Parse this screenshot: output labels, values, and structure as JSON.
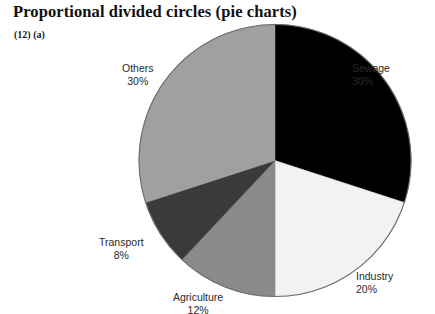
{
  "title": "Proportional divided circles (pie charts)",
  "caption": "(12) (a)",
  "chart_data": {
    "type": "pie",
    "title": "Proportional divided circles (pie charts)",
    "subtitle": "(12) (a)",
    "xlabel": "",
    "ylabel": "",
    "unit": "%",
    "start_angle_deg": 0,
    "direction": "clockwise",
    "legend": "none",
    "grid": false,
    "categories": [
      "Sewage",
      "Industry",
      "Agriculture",
      "Transport",
      "Others"
    ],
    "values": [
      30,
      20,
      12,
      8,
      30
    ],
    "labels": [
      "Sewage\n30%",
      "Industry\n20%",
      "Agriculture\n12%",
      "Transport\n8%",
      "Others\n30%"
    ],
    "colors": [
      "#000000",
      "#f2f2f2",
      "#8a8a8a",
      "#3a3a3a",
      "#a0a0a0"
    ],
    "slices": [
      {
        "name": "Sewage",
        "value": 30,
        "value_label": "30%",
        "color": "#000000",
        "start_deg": 0,
        "end_deg": 108
      },
      {
        "name": "Industry",
        "value": 20,
        "value_label": "20%",
        "color": "#f2f2f2",
        "start_deg": 108,
        "end_deg": 180
      },
      {
        "name": "Agriculture",
        "value": 12,
        "value_label": "12%",
        "color": "#8a8a8a",
        "start_deg": 180,
        "end_deg": 223.2
      },
      {
        "name": "Transport",
        "value": 8,
        "value_label": "8%",
        "color": "#3a3a3a",
        "start_deg": 223.2,
        "end_deg": 252
      },
      {
        "name": "Others",
        "value": 30,
        "value_label": "30%",
        "color": "#a0a0a0",
        "start_deg": 252,
        "end_deg": 360
      }
    ]
  },
  "labels": {
    "sewage": {
      "name": "Sewage",
      "value": "30%"
    },
    "industry": {
      "name": "Industry",
      "value": "20%"
    },
    "agriculture": {
      "name": "Agriculture",
      "value": "12%"
    },
    "transport": {
      "name": "Transport",
      "value": "8%"
    },
    "others": {
      "name": "Others",
      "value": "30%"
    }
  },
  "colors": {
    "sewage": "#000000",
    "industry": "#f2f2f2",
    "agriculture": "#8a8a8a",
    "transport": "#3a3a3a",
    "others": "#a0a0a0",
    "outline": "#6b6b6b",
    "background": "#ffffff",
    "text": "#2a2a2a",
    "title": "#111111"
  }
}
